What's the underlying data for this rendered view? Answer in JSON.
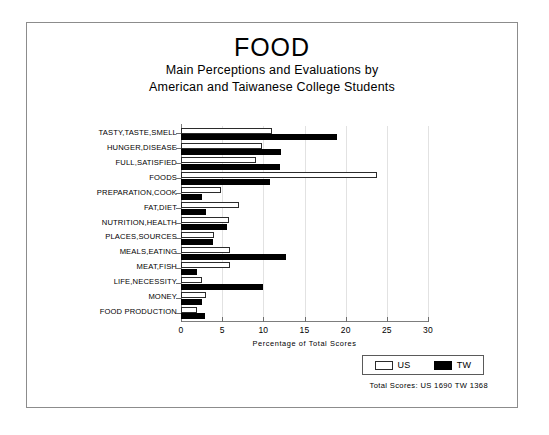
{
  "header": {
    "title": "FOOD",
    "subtitle_line1": "Main Perceptions and Evaluations by",
    "subtitle_line2": "American and Taiwanese College Students"
  },
  "legend": {
    "items": [
      {
        "label": "US",
        "swatch": "white-open-bar-swatch",
        "color": "#ffffff"
      },
      {
        "label": "TW",
        "swatch": "black-filled-bar-swatch",
        "color": "#000000"
      }
    ]
  },
  "footer": {
    "totals": "Total Scores:  US 1690   TW 1368"
  },
  "chart_data": {
    "type": "bar",
    "orientation": "horizontal",
    "title": "FOOD",
    "subtitle": "Main Perceptions and Evaluations by American and Taiwanese College Students",
    "xlabel": "Percentage of Total Scores",
    "ylabel": "",
    "xlim": [
      0,
      30
    ],
    "xticks": [
      0,
      5,
      10,
      15,
      20,
      25,
      30
    ],
    "grid": true,
    "legend_position": "bottom-right",
    "categories": [
      "TASTY,TASTE,SMELL",
      "HUNGER,DISEASE",
      "FULL,SATISFIED",
      "FOODS",
      "PREPARATION,COOK",
      "FAT,DIET",
      "NUTRITION,HEALTH",
      "PLACES,SOURCES",
      "MEALS,EATING",
      "MEAT,FISH",
      "LIFE,NECESSITY",
      "MONEY",
      "FOOD PRODUCTION"
    ],
    "series": [
      {
        "name": "US",
        "color": "#ffffff",
        "values": [
          11.0,
          9.8,
          9.1,
          23.8,
          4.8,
          7.0,
          5.8,
          4.0,
          6.0,
          6.0,
          2.5,
          3.0,
          1.9
        ]
      },
      {
        "name": "TW",
        "color": "#000000",
        "values": [
          19.0,
          12.2,
          12.0,
          10.8,
          2.6,
          3.0,
          5.6,
          3.9,
          12.8,
          1.9,
          9.9,
          2.6,
          2.9
        ]
      }
    ],
    "totals": {
      "US": 1690,
      "TW": 1368
    }
  }
}
